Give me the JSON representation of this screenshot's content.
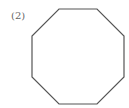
{
  "label": "(2)",
  "shape": {
    "type": "regular-octagon",
    "stroke": "#555555",
    "points": "59,9 97,9 124,36 124,77 97,104 59,104 32,77 32,36"
  }
}
